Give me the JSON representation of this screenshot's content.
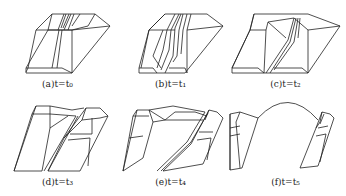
{
  "figure": {
    "panels": [
      {
        "id": "a",
        "caption": "(a)t=t₀"
      },
      {
        "id": "b",
        "caption": "(b)t=t₁"
      },
      {
        "id": "c",
        "caption": "(c)t=t₂"
      },
      {
        "id": "d",
        "caption": "(d)t=t₃"
      },
      {
        "id": "e",
        "caption": "(e)t=t₄"
      },
      {
        "id": "f",
        "caption": "(f)t=t₅"
      }
    ]
  }
}
